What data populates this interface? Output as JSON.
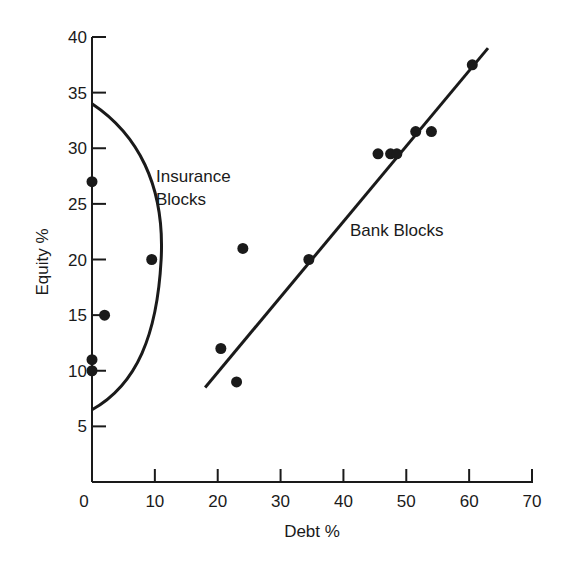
{
  "chart_data": {
    "type": "scatter",
    "title": "",
    "xlabel": "Debt %",
    "ylabel": "Equity %",
    "xlim": [
      0,
      70
    ],
    "ylim": [
      0,
      40
    ],
    "xticks": [
      0,
      10,
      20,
      30,
      40,
      50,
      60,
      70
    ],
    "yticks": [
      5,
      10,
      15,
      20,
      25,
      30,
      35,
      40
    ],
    "grid": false,
    "legend": null,
    "series": [
      {
        "name": "Insurance Blocks",
        "points": [
          {
            "x": 0,
            "y": 27
          },
          {
            "x": 9.5,
            "y": 20
          },
          {
            "x": 2,
            "y": 15
          },
          {
            "x": 0,
            "y": 11
          },
          {
            "x": 0,
            "y": 10
          }
        ],
        "boundary": {
          "type": "arc",
          "from": {
            "x": 0,
            "y": 34
          },
          "apex": {
            "x": 11,
            "y": 20
          },
          "to": {
            "x": 0,
            "y": 6.5
          }
        }
      },
      {
        "name": "Bank Blocks",
        "points": [
          {
            "x": 20.5,
            "y": 12
          },
          {
            "x": 24,
            "y": 21
          },
          {
            "x": 23,
            "y": 9
          },
          {
            "x": 34.5,
            "y": 20
          },
          {
            "x": 45.5,
            "y": 29.5
          },
          {
            "x": 47.5,
            "y": 29.5
          },
          {
            "x": 48.5,
            "y": 29.5
          },
          {
            "x": 51.5,
            "y": 31.5
          },
          {
            "x": 54,
            "y": 31.5
          },
          {
            "x": 60.5,
            "y": 37.5
          }
        ],
        "fit_line": {
          "from": {
            "x": 18,
            "y": 8.5
          },
          "to": {
            "x": 63,
            "y": 39
          }
        }
      }
    ],
    "annotations": [
      {
        "text": "Insurance Blocks",
        "lines": [
          "Insurance",
          "Blocks"
        ],
        "x": 11,
        "y": 27
      },
      {
        "text": "Bank Blocks",
        "x": 40,
        "y": 22.5
      }
    ]
  },
  "labels": {
    "xlabel": "Debt %",
    "ylabel": "Equity %",
    "insurance_line1": "Insurance",
    "insurance_line2": "Blocks",
    "bank": "Bank Blocks"
  }
}
